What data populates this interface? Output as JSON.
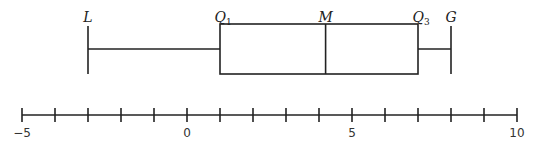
{
  "chart_data": {
    "type": "boxplot",
    "title": "",
    "orientation": "horizontal",
    "five_number_summary": {
      "L": -3,
      "Q1": 1,
      "M": 4.2,
      "Q3": 7,
      "G": 8
    },
    "labels": {
      "L": {
        "main": "L",
        "sub": ""
      },
      "Q1": {
        "main": "Q",
        "sub": "1"
      },
      "M": {
        "main": "M",
        "sub": ""
      },
      "Q3": {
        "main": "Q",
        "sub": "3"
      },
      "G": {
        "main": "G",
        "sub": ""
      }
    },
    "axis": {
      "min": -5,
      "max": 10,
      "tick_step": 1,
      "tick_labels": [
        {
          "value": -5,
          "text": "−5"
        },
        {
          "value": 0,
          "text": "0"
        },
        {
          "value": 5,
          "text": "5"
        },
        {
          "value": 10,
          "text": "10"
        }
      ]
    },
    "colors": {
      "stroke": "#222222",
      "text": "#222222",
      "background": "#ffffff"
    }
  }
}
